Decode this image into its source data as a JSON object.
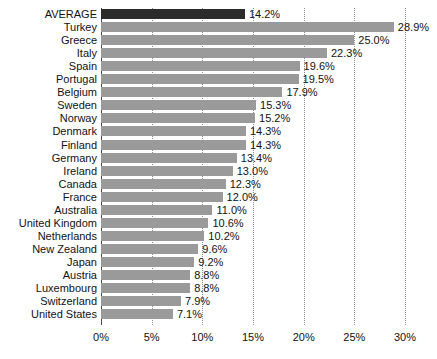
{
  "chart_data": {
    "type": "bar",
    "orientation": "horizontal",
    "title": "",
    "subtitle": "",
    "xlabel": "",
    "ylabel": "",
    "xlim": [
      0,
      30
    ],
    "xticks": [
      0,
      5,
      10,
      15,
      20,
      25,
      30
    ],
    "xtick_labels": [
      "0%",
      "5%",
      "10%",
      "15%",
      "20%",
      "25%",
      "30%"
    ],
    "grid": true,
    "grid_style": "dotted-vertical",
    "legend": null,
    "value_label_suffix": "%",
    "bar_color": "#9a9a9a",
    "highlight_color": "#2b2b2b",
    "highlight_category": "AVERAGE",
    "categories": [
      "AVERAGE",
      "Turkey",
      "Greece",
      "Italy",
      "Spain",
      "Portugal",
      "Belgium",
      "Sweden",
      "Norway",
      "Denmark",
      "Finland",
      "Germany",
      "Ireland",
      "Canada",
      "France",
      "Australia",
      "United Kingdom",
      "Netherlands",
      "New Zealand",
      "Japan",
      "Austria",
      "Luxembourg",
      "Switzerland",
      "United States"
    ],
    "values": [
      14.2,
      28.9,
      25.0,
      22.3,
      19.6,
      19.5,
      17.9,
      15.3,
      15.2,
      14.3,
      14.3,
      13.4,
      13.0,
      12.3,
      12.0,
      11.0,
      10.6,
      10.2,
      9.6,
      9.2,
      8.8,
      8.8,
      7.9,
      7.1
    ],
    "value_labels": [
      "14.2%",
      "28.9%",
      "25.0%",
      "22.3%",
      "19.6%",
      "19.5%",
      "17.9%",
      "15.3%",
      "15.2%",
      "14.3%",
      "14.3%",
      "13.4%",
      "13.0%",
      "12.3%",
      "12.0%",
      "11.0%",
      "10.6%",
      "10.2%",
      "9.6%",
      "9.2%",
      "8.8%",
      "8.8%",
      "7.9%",
      "7.1%"
    ]
  }
}
